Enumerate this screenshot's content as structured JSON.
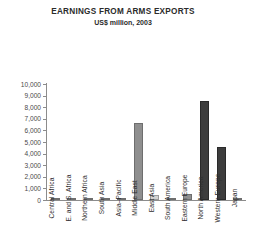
{
  "header": {
    "title": "EARNINGS FROM ARMS EXPORTS",
    "subtitle": "US$ million, 2003"
  },
  "chart_data": {
    "type": "bar",
    "title": "EARNINGS FROM ARMS EXPORTS",
    "subtitle": "US$ million, 2003",
    "xlabel": "",
    "ylabel": "",
    "ylim": [
      0,
      10000
    ],
    "ytick_step": 1000,
    "grid": false,
    "legend": null,
    "categories": [
      "Central Africa",
      "E. and S. Africa",
      "Northern Africa",
      "South Asia",
      "Asia–Pacific",
      "Middle East",
      "East Asia",
      "South America",
      "Eastern Europe",
      "North America",
      "Western Europe",
      "Japan"
    ],
    "values": [
      20,
      110,
      190,
      60,
      110,
      6600,
      420,
      30,
      560,
      8500,
      4600,
      20
    ],
    "bar_shades": [
      "mid",
      "mid",
      "mid",
      "mid",
      "mid",
      "mid",
      "light",
      "mid",
      "mid",
      "dark",
      "dark",
      "mid"
    ],
    "ytick_labels": [
      "10,000",
      "9,000",
      "8,000",
      "7,000",
      "6,000",
      "5,000",
      "4,000",
      "3,000",
      "2,000",
      "1,000",
      "0"
    ],
    "ytick_values": [
      10000,
      9000,
      8000,
      7000,
      6000,
      5000,
      4000,
      3000,
      2000,
      1000,
      0
    ]
  },
  "colors": {
    "bar_mid": "#8f8f8f",
    "bar_light": "#d2d2d2",
    "bar_dark": "#3d3d3d",
    "axis": "#8c8c8c",
    "text": "#2b2b2b",
    "background": "#ffffff"
  }
}
